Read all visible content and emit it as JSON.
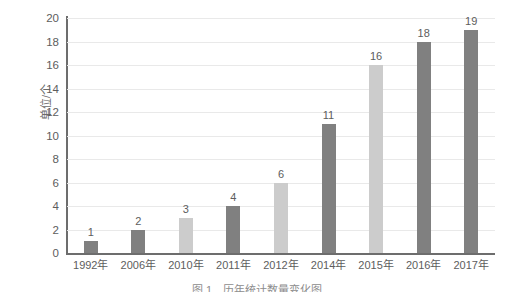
{
  "chart_data": {
    "type": "bar",
    "title": "",
    "xlabel": "",
    "ylabel": "单位/个",
    "ylim": [
      0,
      20
    ],
    "ytick_step": 2,
    "yticks": [
      20,
      18,
      16,
      14,
      12,
      10,
      8,
      6,
      4,
      2,
      0
    ],
    "grid": true,
    "legend": null,
    "categories": [
      "1992年",
      "2006年",
      "2010年",
      "2011年",
      "2012年",
      "2014年",
      "2015年",
      "2016年",
      "2017年"
    ],
    "values": [
      1,
      2,
      3,
      4,
      6,
      11,
      16,
      18,
      19
    ],
    "bar_shades": [
      "dark",
      "dark",
      "light",
      "dark",
      "light",
      "dark",
      "light",
      "dark",
      "dark"
    ],
    "data_labels": [
      "1",
      "2",
      "3",
      "4",
      "6",
      "11",
      "16",
      "18",
      "19"
    ],
    "colors": {
      "bar_dark": "#808080",
      "bar_light": "#cccccc",
      "gridline": "#e9e9e9",
      "axis": "#6d6d6d",
      "text": "#5d5d5d",
      "background": "#ffffff"
    }
  },
  "caption": "图 1　历年统计数量变化图"
}
